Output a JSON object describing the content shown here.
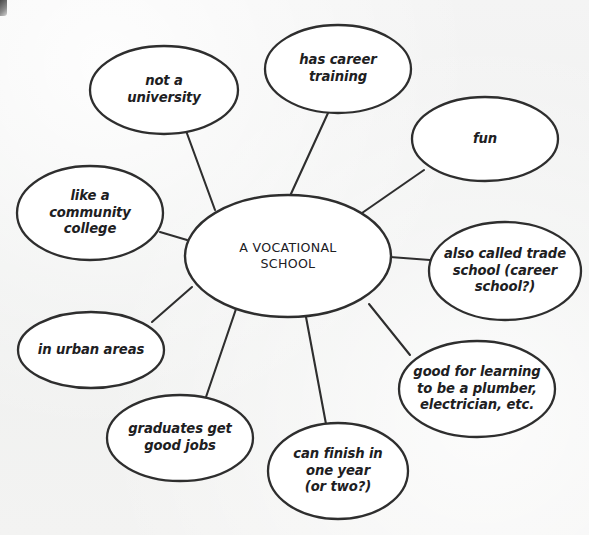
{
  "diagram": {
    "type": "bubble-map",
    "title_node": {
      "id": "center",
      "text": "A VOCATIONAL\nSCHOOL",
      "cx": 288,
      "cy": 256,
      "rx": 103,
      "ry": 61
    },
    "background_color": "#f1f1f1",
    "stroke_color": "#2e2e2e",
    "fill_color": "#ffffff",
    "nodes": [
      {
        "id": "not-a-university",
        "text": "not a\nuniversity",
        "cx": 164,
        "cy": 90,
        "rx": 74,
        "ry": 44
      },
      {
        "id": "has-career-training",
        "text": "has career\ntraining",
        "cx": 338,
        "cy": 69,
        "rx": 73,
        "ry": 44
      },
      {
        "id": "fun",
        "text": "fun",
        "cx": 485,
        "cy": 139,
        "rx": 73,
        "ry": 42
      },
      {
        "id": "also-called-trade-school",
        "text": "also called trade\nschool (career\nschool?)",
        "cx": 505,
        "cy": 271,
        "rx": 76,
        "ry": 49
      },
      {
        "id": "good-for-learning-trades",
        "text": "good for learning\nto be a plumber,\nelectrician, etc.",
        "cx": 477,
        "cy": 389,
        "rx": 78,
        "ry": 48
      },
      {
        "id": "can-finish-in-one-year",
        "text": "can finish in\none year\n(or two?)",
        "cx": 338,
        "cy": 471,
        "rx": 70,
        "ry": 48
      },
      {
        "id": "graduates-get-good-jobs",
        "text": "graduates get\ngood jobs",
        "cx": 180,
        "cy": 438,
        "rx": 73,
        "ry": 43
      },
      {
        "id": "in-urban-areas",
        "text": "in urban areas",
        "cx": 91,
        "cy": 350,
        "rx": 73,
        "ry": 38
      },
      {
        "id": "like-a-community-college",
        "text": "like a\ncommunity\ncollege",
        "cx": 90,
        "cy": 213,
        "rx": 73,
        "ry": 47
      }
    ],
    "connectors": [
      {
        "id": "link-not-a-university",
        "x1": 215,
        "y1": 210,
        "x2": 185,
        "y2": 128
      },
      {
        "id": "link-has-career-training",
        "x1": 290,
        "y1": 196,
        "x2": 328,
        "y2": 113
      },
      {
        "id": "link-fun",
        "x1": 362,
        "y1": 213,
        "x2": 424,
        "y2": 170
      },
      {
        "id": "link-also-called-trade-school",
        "x1": 390,
        "y1": 257,
        "x2": 430,
        "y2": 260
      },
      {
        "id": "link-good-for-learning-trades",
        "x1": 369,
        "y1": 304,
        "x2": 410,
        "y2": 355
      },
      {
        "id": "link-can-finish-in-one-year",
        "x1": 306,
        "y1": 317,
        "x2": 326,
        "y2": 424
      },
      {
        "id": "link-graduates-get-good-jobs",
        "x1": 236,
        "y1": 309,
        "x2": 206,
        "y2": 397
      },
      {
        "id": "link-in-urban-areas",
        "x1": 192,
        "y1": 287,
        "x2": 152,
        "y2": 322
      },
      {
        "id": "link-like-a-community-college",
        "x1": 187,
        "y1": 240,
        "x2": 160,
        "y2": 232
      }
    ]
  }
}
